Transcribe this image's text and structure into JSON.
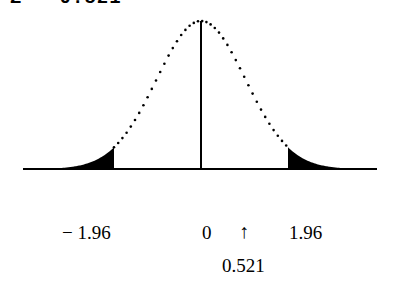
{
  "header": {
    "equation": "Z = 0.521"
  },
  "chart_data": {
    "type": "area",
    "title": "Z = 0.521",
    "xlabel": "",
    "ylabel": "",
    "x_ticks": [
      {
        "value": -1.96,
        "label": "− 1.96"
      },
      {
        "value": 0,
        "label": "0"
      },
      {
        "value": 1.96,
        "label": "1.96"
      }
    ],
    "marker": {
      "value": 0.521,
      "arrow": "↑",
      "label": "0.521"
    },
    "shaded_regions": [
      {
        "from": "-inf",
        "to": -1.96,
        "fill": "#000000"
      },
      {
        "from": 1.96,
        "to": "inf",
        "fill": "#000000"
      }
    ],
    "critical_values": [
      -1.96,
      1.96
    ],
    "grid": false,
    "legend": null
  },
  "colors": {
    "curve": "#000000",
    "fill": "#000000",
    "background": "#ffffff"
  }
}
